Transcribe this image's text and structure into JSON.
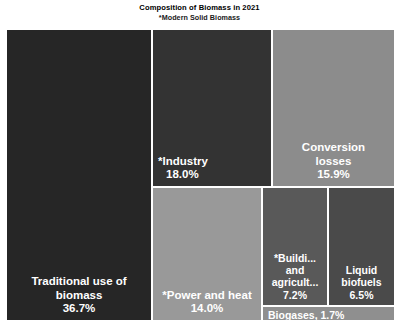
{
  "chart_data": {
    "type": "treemap",
    "title": "Composition of Biomass in 2021",
    "subtitle": "*Modern Solid Biomass",
    "xlabel": "",
    "ylabel": "",
    "unit": "%",
    "legend": "none",
    "grid": false,
    "categories": [
      "Traditional use of biomass",
      "*Industry",
      "Conversion losses",
      "*Power and heat",
      "*Buildi... and agricult...",
      "Liquid biofuels",
      "Biogases"
    ],
    "values": [
      36.7,
      18.0,
      15.9,
      14.0,
      7.2,
      6.5,
      1.7
    ],
    "tiles": [
      {
        "name": "traditional",
        "label": "Traditional use of\nbiomass",
        "value": 36.7,
        "value_text": "36.7%",
        "color": "#262626",
        "text_color": "#ffffff",
        "align": "center"
      },
      {
        "name": "industry",
        "label": "*Industry",
        "value": 18.0,
        "value_text": "18.0%",
        "color": "#333333",
        "text_color": "#ffffff",
        "align": "left"
      },
      {
        "name": "conversion-losses",
        "label": "Conversion\nlosses",
        "value": 15.9,
        "value_text": "15.9%",
        "color": "#8c8c8c",
        "text_color": "#ffffff",
        "align": "center"
      },
      {
        "name": "power-and-heat",
        "label": "*Power and heat",
        "value": 14.0,
        "value_text": "14.0%",
        "color": "#999999",
        "text_color": "#ffffff",
        "align": "center"
      },
      {
        "name": "buildings-and-agriculture",
        "label": "*Buildi...\nand\nagricult...",
        "value": 7.2,
        "value_text": "7.2%",
        "color": "#595959",
        "text_color": "#ffffff",
        "align": "center"
      },
      {
        "name": "liquid-biofuels",
        "label": "Liquid\nbiofuels",
        "value": 6.5,
        "value_text": "6.5%",
        "color": "#4a4a4a",
        "text_color": "#ffffff",
        "align": "center"
      },
      {
        "name": "biogases",
        "label": "Biogases, 1.7%",
        "value": 1.7,
        "value_text": "1.7%",
        "color": "#8f8f8f",
        "text_color": "#ffffff",
        "align": "left"
      }
    ]
  },
  "chart": {
    "title": "Composition of Biomass in 2021",
    "subtitle": "*Modern Solid Biomass",
    "tiles": {
      "traditional": {
        "label": "Traditional use of\nbiomass",
        "value_text": "36.7%"
      },
      "industry": {
        "label": "*Industry",
        "value_text": "18.0%"
      },
      "conversion": {
        "label": "Conversion\nlosses",
        "value_text": "15.9%"
      },
      "power": {
        "label": "*Power and heat",
        "value_text": "14.0%"
      },
      "buildings": {
        "label": "*Buildi...\nand\nagricult...",
        "value_text": "7.2%"
      },
      "liquid": {
        "label": "Liquid\nbiofuels",
        "value_text": "6.5%"
      },
      "biogases": {
        "label": "Biogases, 1.7%"
      }
    }
  }
}
